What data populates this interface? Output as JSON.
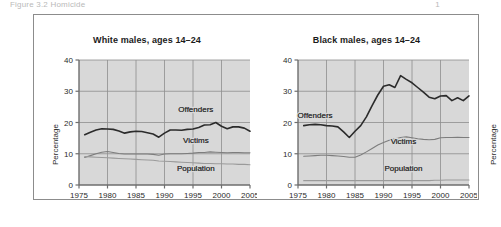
{
  "page": {
    "cut_off_caption_left": "Figure 3.2   Homicide",
    "cut_off_caption_right": "1"
  },
  "chart_data": [
    {
      "id": "white-males",
      "type": "line",
      "title": "White males, ages 14–24",
      "xlabel": "",
      "ylabel": "Percentage",
      "xlim": [
        1975,
        2005
      ],
      "ylim": [
        0,
        40
      ],
      "xticks": [
        1975,
        1980,
        1985,
        1990,
        1995,
        2000,
        2005
      ],
      "yticks": [
        0,
        10,
        20,
        30,
        40
      ],
      "grid": true,
      "legend": "inline-labels",
      "x": [
        1976,
        1977,
        1978,
        1979,
        1980,
        1981,
        1982,
        1983,
        1984,
        1985,
        1986,
        1987,
        1988,
        1989,
        1990,
        1991,
        1992,
        1993,
        1994,
        1995,
        1996,
        1997,
        1998,
        1999,
        2000,
        2001,
        2002,
        2003,
        2004,
        2005
      ],
      "series": [
        {
          "name": "Offenders",
          "color": "#2b2b2b",
          "label_x": 1995.5,
          "label_y": 23.5,
          "values": [
            16.1,
            16.9,
            17.6,
            18.0,
            17.9,
            17.8,
            17.3,
            16.6,
            17.0,
            17.2,
            17.1,
            16.7,
            16.3,
            15.3,
            16.6,
            17.6,
            17.6,
            17.5,
            17.8,
            17.9,
            18.4,
            19.2,
            19.3,
            20.0,
            18.8,
            18.0,
            18.6,
            18.6,
            18.2,
            17.2
          ]
        },
        {
          "name": "Victims",
          "color": "#7d7d7d",
          "label_x": 1995.5,
          "label_y": 13.4,
          "values": [
            8.8,
            9.4,
            10.0,
            10.5,
            10.7,
            10.4,
            10.1,
            9.9,
            9.9,
            9.9,
            9.9,
            9.9,
            9.8,
            9.5,
            9.9,
            10.0,
            10.0,
            10.0,
            10.1,
            10.2,
            10.4,
            10.4,
            10.6,
            10.5,
            10.4,
            10.3,
            10.4,
            10.4,
            10.3,
            10.3
          ]
        },
        {
          "name": "Population",
          "color": "#9a9a9a",
          "label_x": 1995.5,
          "label_y": 4.6,
          "values": [
            9.1,
            9.0,
            8.9,
            8.8,
            8.7,
            8.6,
            8.5,
            8.4,
            8.3,
            8.2,
            8.1,
            8.0,
            7.9,
            7.7,
            7.6,
            7.5,
            7.4,
            7.3,
            7.2,
            7.1,
            7.0,
            6.9,
            6.9,
            6.8,
            6.8,
            6.7,
            6.7,
            6.6,
            6.6,
            6.5
          ]
        }
      ]
    },
    {
      "id": "black-males",
      "type": "line",
      "title": "Black males, ages 14–24",
      "xlabel": "",
      "ylabel": "Percentage",
      "xlim": [
        1975,
        2005
      ],
      "ylim": [
        0,
        40
      ],
      "xticks": [
        1975,
        1980,
        1985,
        1990,
        1995,
        2000,
        2005
      ],
      "yticks": [
        0,
        10,
        20,
        30,
        40
      ],
      "grid": true,
      "legend": "inline-labels",
      "x": [
        1976,
        1977,
        1978,
        1979,
        1980,
        1981,
        1982,
        1983,
        1984,
        1985,
        1986,
        1987,
        1988,
        1989,
        1990,
        1991,
        1992,
        1993,
        1994,
        1995,
        1996,
        1997,
        1998,
        1999,
        2000,
        2001,
        2002,
        2003,
        2004,
        2005
      ],
      "series": [
        {
          "name": "Offenders",
          "color": "#2b2b2b",
          "label_x": 1978.0,
          "label_y": 21.6,
          "values": [
            19.0,
            19.3,
            19.4,
            19.3,
            19.0,
            18.9,
            18.6,
            17.0,
            15.2,
            17.2,
            19.0,
            21.8,
            25.4,
            28.8,
            31.6,
            32.1,
            31.2,
            35.0,
            33.8,
            32.7,
            31.2,
            29.7,
            28.1,
            27.6,
            28.5,
            28.6,
            27.0,
            27.9,
            27.0,
            28.5
          ]
        },
        {
          "name": "Victims",
          "color": "#7d7d7d",
          "label_x": 1993.5,
          "label_y": 13.0,
          "values": [
            9.2,
            9.3,
            9.4,
            9.5,
            9.5,
            9.4,
            9.3,
            9.1,
            8.9,
            8.9,
            9.6,
            10.6,
            11.7,
            12.8,
            13.6,
            14.3,
            14.8,
            15.2,
            15.4,
            15.1,
            14.8,
            14.6,
            14.5,
            14.6,
            15.1,
            15.2,
            15.2,
            15.3,
            15.2,
            15.2
          ]
        },
        {
          "name": "Population",
          "color": "#9a9a9a",
          "label_x": 1993.5,
          "label_y": 4.6,
          "values": [
            1.4,
            1.4,
            1.4,
            1.4,
            1.4,
            1.4,
            1.4,
            1.4,
            1.4,
            1.4,
            1.4,
            1.4,
            1.4,
            1.4,
            1.4,
            1.4,
            1.4,
            1.4,
            1.4,
            1.4,
            1.4,
            1.4,
            1.4,
            1.5,
            1.5,
            1.6,
            1.6,
            1.6,
            1.6,
            1.6
          ]
        }
      ]
    }
  ]
}
